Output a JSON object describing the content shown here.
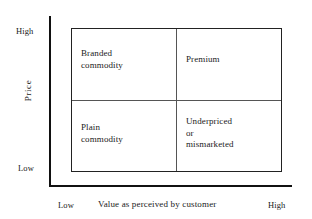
{
  "chart_data": {
    "type": "table",
    "title": "",
    "xlabel": "Value as perceived by customer",
    "ylabel": "Price",
    "x_axis": {
      "low_label": "Low",
      "high_label": "High"
    },
    "y_axis": {
      "low_label": "Low",
      "high_label": "High"
    },
    "grid": true,
    "categories": [
      "Low value",
      "High value"
    ],
    "rows": [
      "High price",
      "Low price"
    ],
    "cells": [
      {
        "row": "High price",
        "column": "Low value",
        "lines": [
          "Branded",
          "commodity"
        ]
      },
      {
        "row": "High price",
        "column": "High value",
        "lines": [
          "Premium"
        ]
      },
      {
        "row": "Low price",
        "column": "Low value",
        "lines": [
          "Plain",
          "commodity"
        ]
      },
      {
        "row": "Low price",
        "column": "High value",
        "lines": [
          "Underpriced",
          "or",
          "mismarketed"
        ]
      }
    ]
  },
  "axes": {
    "y_title": "Price",
    "y_high": "High",
    "y_low": "Low",
    "x_title": "Value as perceived by customer",
    "x_low": "Low",
    "x_high": "High"
  },
  "quadrants": {
    "top_left": {
      "line1": "Branded",
      "line2": "commodity"
    },
    "top_right": {
      "line1": "Premium"
    },
    "bottom_left": {
      "line1": "Plain",
      "line2": "commodity"
    },
    "bottom_right": {
      "line1": "Underpriced",
      "line2": "or",
      "line3": "mismarketed"
    }
  },
  "colors": {
    "axis": "#111111",
    "border": "#222222",
    "divider": "#555555",
    "text": "#1a1a1a",
    "background": "#ffffff"
  }
}
